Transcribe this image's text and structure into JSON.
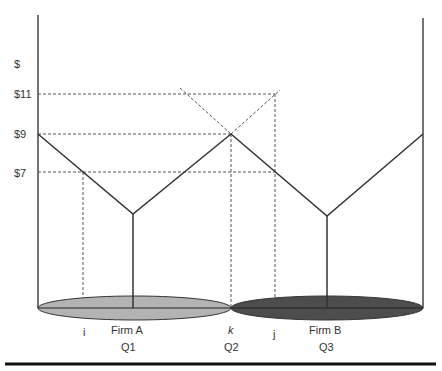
{
  "diagram": {
    "y_axis_label": "$",
    "price_labels": [
      "$11",
      "$9",
      "$7"
    ],
    "market_labels": {
      "i": "i",
      "k": "k",
      "j": "j",
      "firm_a": "Firm A",
      "firm_b": "Firm B",
      "q1": "Q1",
      "q2": "Q2",
      "q3": "Q3"
    },
    "colors": {
      "firm_a_fill": "#b3b3b3",
      "firm_b_fill": "#4d4d4d",
      "line": "#333333",
      "dashed": "#555555"
    }
  }
}
